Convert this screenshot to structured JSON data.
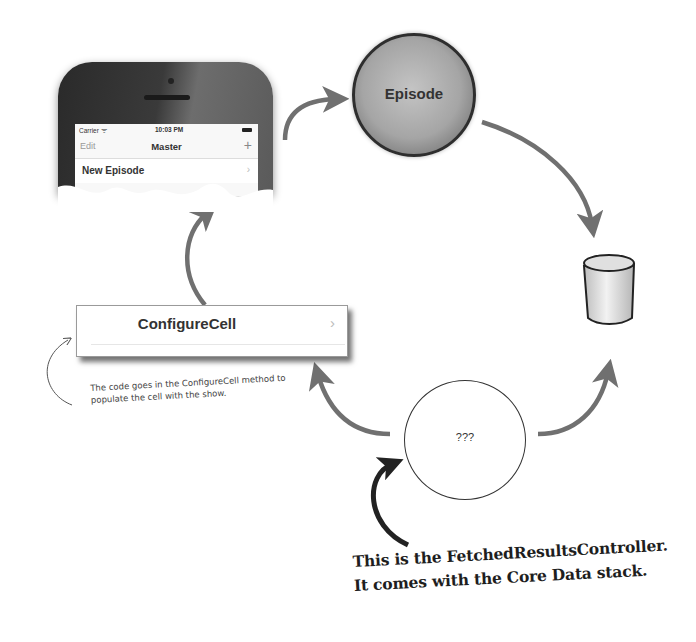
{
  "phone": {
    "status_carrier": "Carrier ᯤ",
    "status_time": "10:03 PM",
    "nav_edit": "Edit",
    "nav_title": "Master",
    "nav_add": "+",
    "cell_label": "New Episode",
    "cell_chevron": "›"
  },
  "nodes": {
    "episode": "Episode",
    "configure_cell": "ConfigureCell",
    "configure_chevron": "›",
    "fetched": "???"
  },
  "annotations": {
    "small_note": "The code goes in the ConfigureCell method to populate the cell with the show.",
    "big_note_line1": "This is the FetchedResultsController.",
    "big_note_line2": "It comes with the Core Data stack."
  },
  "colors": {
    "arrow": "#707070",
    "dark_arrow": "#222222",
    "background": "#ffffff"
  }
}
